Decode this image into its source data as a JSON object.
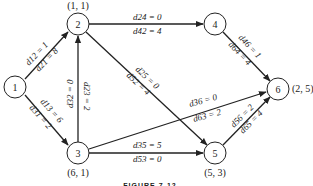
{
  "diagram": {
    "caption": "FIGURE 7-12",
    "nodes": [
      {
        "id": "1",
        "label": "1",
        "x": 15,
        "y": 87,
        "coord": ""
      },
      {
        "id": "2",
        "label": "2",
        "x": 78,
        "y": 24,
        "coord": "(1, 1)"
      },
      {
        "id": "3",
        "label": "3",
        "x": 78,
        "y": 153,
        "coord": "(6, 1)"
      },
      {
        "id": "4",
        "label": "4",
        "x": 215,
        "y": 24,
        "coord": ""
      },
      {
        "id": "5",
        "label": "5",
        "x": 215,
        "y": 153,
        "coord": "(5, 3)"
      },
      {
        "id": "6",
        "label": "6",
        "x": 278,
        "y": 89,
        "coord": "(2, 5)"
      }
    ],
    "edges": [
      {
        "from": "1",
        "to": "2",
        "label_a": "d12 = 1",
        "label_b": "d21 = 8"
      },
      {
        "from": "1",
        "to": "3",
        "label_a": "d13 = 6",
        "label_b": "d31 = 2"
      },
      {
        "from": "3",
        "to": "2",
        "label_a": "d32 = 0",
        "label_b": "d23 = 2"
      },
      {
        "from": "2",
        "to": "4",
        "label_a": "d24 = 0",
        "label_b": "d42 = 4"
      },
      {
        "from": "2",
        "to": "5",
        "label_a": "d25 = 0",
        "label_b": "d52 = 4"
      },
      {
        "from": "4",
        "to": "6",
        "label_a": "d46 = 1",
        "label_b": "d64 = 4"
      },
      {
        "from": "3",
        "to": "6",
        "label_a": "d36 = 0",
        "label_b": "d63 = 2"
      },
      {
        "from": "3",
        "to": "5",
        "label_a": "d35 = 5",
        "label_b": "d53 = 0"
      },
      {
        "from": "5",
        "to": "6",
        "label_a": "d56 = 2",
        "label_b": "d65 = 4"
      }
    ]
  },
  "labels": {
    "n1": "1",
    "n2": "2",
    "n3": "3",
    "n4": "4",
    "n5": "5",
    "n6": "6",
    "c2": "(1, 1)",
    "c3": "(6, 1)",
    "c5": "(5, 3)",
    "c6": "(2, 5)",
    "e12a": "d12 = 1",
    "e12b": "d21 = 8",
    "e13a": "d13 = 6",
    "e13b": "d31 = 2",
    "e32a": "d32 = 0",
    "e32b": "d23 = 2",
    "e24a": "d24 = 0",
    "e24b": "d42 = 4",
    "e25a": "d25 = 0",
    "e25b": "d52 = 4",
    "e46a": "d46 = 1",
    "e46b": "d64 = 4",
    "e36a": "d36 = 0",
    "e36b": "d63 = 2",
    "e35a": "d35 = 5",
    "e35b": "d53 = 0",
    "e56a": "d56 = 2",
    "e56b": "d65 = 4",
    "caption": "FIGURE 7-12"
  }
}
